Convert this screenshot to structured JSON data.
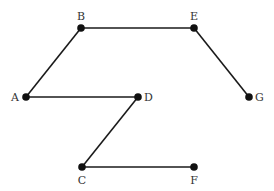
{
  "diagram": {
    "type": "graph",
    "background": "#ffffff",
    "node_color": "#111111",
    "edge_color": "#1a1a1a",
    "nodes": [
      {
        "id": "A",
        "label": "A",
        "x": 26,
        "y": 97,
        "label_pos": "left"
      },
      {
        "id": "B",
        "label": "B",
        "x": 81,
        "y": 28,
        "label_pos": "top"
      },
      {
        "id": "E",
        "label": "E",
        "x": 194,
        "y": 28,
        "label_pos": "top"
      },
      {
        "id": "G",
        "label": "G",
        "x": 249,
        "y": 97,
        "label_pos": "right"
      },
      {
        "id": "D",
        "label": "D",
        "x": 138,
        "y": 97,
        "label_pos": "right"
      },
      {
        "id": "C",
        "label": "C",
        "x": 82,
        "y": 167,
        "label_pos": "bottom"
      },
      {
        "id": "F",
        "label": "F",
        "x": 194,
        "y": 167,
        "label_pos": "bottom"
      }
    ],
    "edges": [
      [
        "A",
        "B"
      ],
      [
        "B",
        "E"
      ],
      [
        "E",
        "G"
      ],
      [
        "A",
        "D"
      ],
      [
        "D",
        "C"
      ],
      [
        "C",
        "F"
      ]
    ]
  }
}
